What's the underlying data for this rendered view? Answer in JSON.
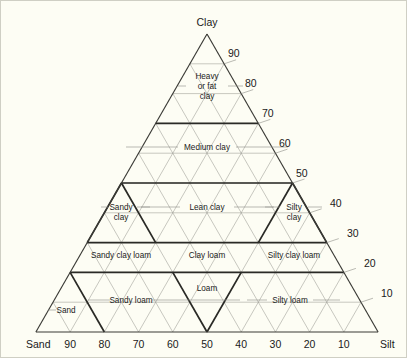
{
  "figure": {
    "type": "ternary-diagram",
    "background_color": "#fdfdf4",
    "grid_color": "#9a9a93",
    "outline_color": "#3a3a35",
    "boundary_color": "#2a2a26",
    "text_color": "#1a1a1a"
  },
  "axes": {
    "apex": {
      "name": "clay-axis",
      "label": "Clay"
    },
    "left": {
      "name": "sand-axis",
      "label": "Sand"
    },
    "right": {
      "name": "silt-axis",
      "label": "Silt"
    },
    "bottom_ticks": [
      "90",
      "80",
      "70",
      "60",
      "50",
      "40",
      "30",
      "20",
      "10"
    ],
    "right_ticks": [
      "90",
      "80",
      "70",
      "60",
      "50",
      "40",
      "30",
      "20",
      "10"
    ],
    "tick_step": 10,
    "range": [
      0,
      100
    ]
  },
  "regions": [
    {
      "name": "heavy-or-fat-clay",
      "lines": [
        "Heavy",
        "or fat",
        "clay"
      ]
    },
    {
      "name": "medium-clay",
      "lines": [
        "Medium clay"
      ]
    },
    {
      "name": "lean-clay",
      "lines": [
        "Lean clay"
      ]
    },
    {
      "name": "sandy-clay",
      "lines": [
        "Sandy",
        "clay"
      ]
    },
    {
      "name": "silty-clay",
      "lines": [
        "Silty",
        "clay"
      ]
    },
    {
      "name": "sandy-clay-loam",
      "lines": [
        "Sandy clay loam"
      ]
    },
    {
      "name": "clay-loam",
      "lines": [
        "Clay loam"
      ]
    },
    {
      "name": "silty-clay-loam",
      "lines": [
        "Silty clay loam"
      ]
    },
    {
      "name": "sand",
      "lines": [
        "Sand"
      ]
    },
    {
      "name": "sandy-loam",
      "lines": [
        "Sandy loam"
      ]
    },
    {
      "name": "loam",
      "lines": [
        "Loam"
      ]
    },
    {
      "name": "silty-loam",
      "lines": [
        "Silty loam"
      ]
    }
  ],
  "labels": {
    "clay": "Clay",
    "sand": "Sand",
    "silt": "Silt",
    "t10": "10",
    "t20": "20",
    "t30": "30",
    "t40": "40",
    "t50": "50",
    "t60": "60",
    "t70": "70",
    "t80": "80",
    "t90": "90",
    "b10": "10",
    "b20": "20",
    "b30": "30",
    "b40": "40",
    "b50": "50",
    "b60": "60",
    "b70": "70",
    "b80": "80",
    "b90": "90",
    "heavy1": "Heavy",
    "heavy2": "or fat",
    "heavy3": "clay",
    "medium_clay": "Medium clay",
    "lean_clay": "Lean clay",
    "sandy_clay1": "Sandy",
    "sandy_clay2": "clay",
    "silty_clay1": "Silty",
    "silty_clay2": "clay",
    "sandy_clay_loam": "Sandy clay loam",
    "clay_loam": "Clay loam",
    "silty_clay_loam": "Silty clay loam",
    "sand_region": "Sand",
    "sandy_loam": "Sandy loam",
    "loam": "Loam",
    "silty_loam": "Silty loam"
  },
  "chart_data": {
    "type": "ternary",
    "title": "",
    "components": [
      "Sand",
      "Silt",
      "Clay"
    ],
    "axis_ranges": {
      "sand": [
        0,
        100
      ],
      "silt": [
        0,
        100
      ],
      "clay": [
        0,
        100
      ]
    },
    "grid": true,
    "grid_step": 10,
    "legend": "none",
    "fields": [
      {
        "label": "Heavy or fat clay",
        "clay_range": [
          70,
          100
        ],
        "centroid": {
          "sand": 15,
          "silt": 15,
          "clay": 70
        }
      },
      {
        "label": "Medium clay",
        "clay_range": [
          50,
          70
        ],
        "centroid": {
          "sand": 20,
          "silt": 20,
          "clay": 60
        }
      },
      {
        "label": "Lean clay",
        "clay_range": [
          30,
          50
        ],
        "centroid": {
          "sand": 25,
          "silt": 35,
          "clay": 40
        }
      },
      {
        "label": "Sandy clay",
        "clay_range": [
          30,
          50
        ],
        "centroid": {
          "sand": 58,
          "silt": 4,
          "clay": 38
        }
      },
      {
        "label": "Silty clay",
        "clay_range": [
          30,
          50
        ],
        "centroid": {
          "sand": 4,
          "silt": 58,
          "clay": 38
        }
      },
      {
        "label": "Sandy clay loam",
        "clay_range": [
          20,
          30
        ],
        "centroid": {
          "sand": 58,
          "silt": 17,
          "clay": 25
        }
      },
      {
        "label": "Clay loam",
        "clay_range": [
          20,
          30
        ],
        "centroid": {
          "sand": 38,
          "silt": 37,
          "clay": 25
        }
      },
      {
        "label": "Silty clay loam",
        "clay_range": [
          20,
          30
        ],
        "centroid": {
          "sand": 17,
          "silt": 58,
          "clay": 25
        }
      },
      {
        "label": "Sand",
        "clay_range": [
          0,
          10
        ],
        "centroid": {
          "sand": 92,
          "silt": 3,
          "clay": 5
        }
      },
      {
        "label": "Sandy loam",
        "clay_range": [
          0,
          20
        ],
        "centroid": {
          "sand": 70,
          "silt": 22,
          "clay": 8
        }
      },
      {
        "label": "Loam",
        "clay_range": [
          0,
          20
        ],
        "centroid": {
          "sand": 45,
          "silt": 43,
          "clay": 12
        }
      },
      {
        "label": "Silty loam",
        "clay_range": [
          0,
          20
        ],
        "centroid": {
          "sand": 22,
          "silt": 70,
          "clay": 8
        }
      }
    ],
    "major_boundaries_clay": [
      20,
      30,
      50,
      70
    ]
  }
}
